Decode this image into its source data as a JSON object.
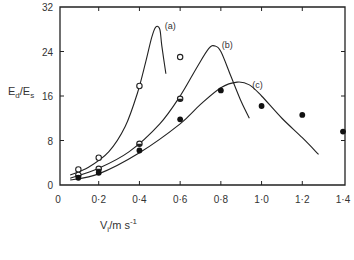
{
  "chart_data": {
    "type": "line",
    "title": "",
    "xlabel": "V_i / m s^-1",
    "ylabel": "E_d / E_s",
    "xlim": [
      0,
      1.4
    ],
    "ylim": [
      0,
      32
    ],
    "xticks": [
      0,
      0.2,
      0.4,
      0.6,
      0.8,
      1.0,
      1.2,
      1.4
    ],
    "xtick_labels": [
      "0",
      "0·2",
      "0·4",
      "0·6",
      "0·8",
      "1·0",
      "1·2",
      "1·4"
    ],
    "yticks": [
      0,
      8,
      16,
      24,
      32
    ],
    "ytick_labels": [
      "0",
      "8",
      "16",
      "24",
      "32"
    ],
    "grid": false,
    "legend": "inline curve labels (a), (b), (c)",
    "series": [
      {
        "name": "(a)",
        "marker": "open-circle",
        "points": [
          [
            0.1,
            2.8
          ],
          [
            0.2,
            4.9
          ],
          [
            0.4,
            17.8
          ],
          [
            0.6,
            23.0
          ]
        ],
        "curve": [
          [
            0.06,
            1.8
          ],
          [
            0.15,
            3.2
          ],
          [
            0.25,
            6.0
          ],
          [
            0.33,
            10.5
          ],
          [
            0.39,
            16.5
          ],
          [
            0.43,
            22.0
          ],
          [
            0.46,
            26.5
          ],
          [
            0.48,
            28.4
          ],
          [
            0.5,
            28.0
          ],
          [
            0.51,
            25.0
          ],
          [
            0.53,
            20.0
          ]
        ]
      },
      {
        "name": "(b)",
        "marker": "half-filled-circle",
        "points": [
          [
            0.1,
            1.8
          ],
          [
            0.2,
            2.9
          ],
          [
            0.4,
            7.4
          ],
          [
            0.6,
            15.5
          ]
        ],
        "curve": [
          [
            0.06,
            1.2
          ],
          [
            0.2,
            3.0
          ],
          [
            0.35,
            6.0
          ],
          [
            0.5,
            11.0
          ],
          [
            0.6,
            16.0
          ],
          [
            0.68,
            21.0
          ],
          [
            0.74,
            24.5
          ],
          [
            0.77,
            25.0
          ],
          [
            0.8,
            24.0
          ],
          [
            0.85,
            19.5
          ],
          [
            0.9,
            15.0
          ],
          [
            0.94,
            12.0
          ]
        ]
      },
      {
        "name": "(c)",
        "marker": "filled-circle",
        "points": [
          [
            0.1,
            1.3
          ],
          [
            0.2,
            2.2
          ],
          [
            0.4,
            6.2
          ],
          [
            0.6,
            11.8
          ],
          [
            0.8,
            17.0
          ],
          [
            1.0,
            14.2
          ],
          [
            1.2,
            12.6
          ],
          [
            1.4,
            9.6
          ]
        ],
        "curve": [
          [
            0.06,
            0.9
          ],
          [
            0.2,
            2.0
          ],
          [
            0.4,
            5.8
          ],
          [
            0.6,
            11.0
          ],
          [
            0.7,
            14.5
          ],
          [
            0.8,
            17.5
          ],
          [
            0.88,
            18.5
          ],
          [
            0.94,
            18.0
          ],
          [
            1.0,
            16.0
          ],
          [
            1.1,
            12.0
          ],
          [
            1.2,
            8.5
          ],
          [
            1.28,
            5.5
          ]
        ]
      }
    ]
  },
  "labels": {
    "y_axis": "E_d/E_s",
    "x_axis": "V_i/m s^-1",
    "curve_a": "(a)",
    "curve_b": "(b)",
    "curve_c": "(c)"
  }
}
